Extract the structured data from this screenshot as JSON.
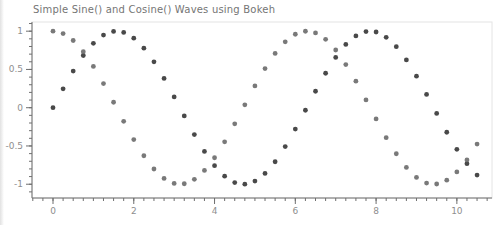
{
  "title": "Simple Sine() and Cosine() Waves using Bokeh",
  "colors": {
    "sine_dots": "#3a3a3a",
    "cosine_dots": "#6e6e6e",
    "axis_line": "#6f6f6f",
    "tick_label": "#8e8e8e",
    "plot_outline": "#e4e4e4",
    "title_text": "#757575",
    "background": "#ffffff"
  },
  "chart_data": {
    "type": "scatter",
    "title": "Simple Sine() and Cosine() Waves using Bokeh",
    "xlabel": "",
    "ylabel": "",
    "grid": false,
    "legend_position": "none",
    "marker": "circle",
    "marker_size": 5,
    "x_range": [
      -0.52,
      10.87
    ],
    "y_range": [
      -1.18,
      1.12
    ],
    "x_ticks": [
      0,
      2,
      4,
      6,
      8,
      10
    ],
    "x_tick_labels": [
      "0",
      "2",
      "4",
      "6",
      "8",
      "10"
    ],
    "x_minor_step": 0.25,
    "y_ticks": [
      1,
      0.5,
      0,
      -0.5,
      -1
    ],
    "y_tick_labels": [
      "1",
      "0.5",
      "0",
      "-0.5",
      "-1"
    ],
    "y_minor_step": 0.1,
    "x": [
      0,
      0.25,
      0.5,
      0.75,
      1,
      1.25,
      1.5,
      1.75,
      2,
      2.25,
      2.5,
      2.75,
      3,
      3.25,
      3.5,
      3.75,
      4,
      4.25,
      4.5,
      4.75,
      5,
      5.25,
      5.5,
      5.75,
      6,
      6.25,
      6.5,
      6.75,
      7,
      7.25,
      7.5,
      7.75,
      8,
      8.25,
      8.5,
      8.75,
      9,
      9.25,
      9.5,
      9.75,
      10,
      10.25,
      10.5
    ],
    "series": [
      {
        "name": "sine",
        "color": "#3a3a3a",
        "values": [
          0,
          0.247,
          0.479,
          0.682,
          0.841,
          0.949,
          0.997,
          0.984,
          0.909,
          0.778,
          0.599,
          0.382,
          0.141,
          -0.108,
          -0.351,
          -0.572,
          -0.757,
          -0.895,
          -0.978,
          -0.999,
          -0.959,
          -0.859,
          -0.706,
          -0.508,
          -0.279,
          -0.033,
          0.215,
          0.45,
          0.657,
          0.827,
          0.938,
          0.995,
          0.989,
          0.92,
          0.798,
          0.625,
          0.412,
          0.174,
          -0.075,
          -0.321,
          -0.544,
          -0.731,
          -0.88
        ]
      },
      {
        "name": "cosine",
        "color": "#6e6e6e",
        "values": [
          1,
          0.969,
          0.878,
          0.732,
          0.54,
          0.315,
          0.071,
          -0.178,
          -0.416,
          -0.628,
          -0.801,
          -0.924,
          -0.99,
          -0.994,
          -0.936,
          -0.82,
          -0.654,
          -0.446,
          -0.211,
          0.038,
          0.284,
          0.512,
          0.709,
          0.861,
          0.96,
          0.999,
          0.977,
          0.893,
          0.754,
          0.563,
          0.347,
          0.102,
          -0.146,
          -0.392,
          -0.602,
          -0.781,
          -0.911,
          -0.985,
          -0.997,
          -0.947,
          -0.839,
          -0.682,
          -0.475
        ]
      }
    ]
  }
}
